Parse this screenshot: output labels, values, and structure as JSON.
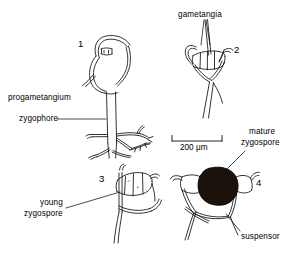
{
  "figure": {
    "background_color": "#ffffff",
    "line_color": "#000000",
    "fill_color": "#1a120b"
  },
  "panels": [
    {
      "id": "panel-1",
      "number": "1",
      "number_x": 78,
      "number_y": 38
    },
    {
      "id": "panel-2",
      "number": "2",
      "number_x": 234,
      "number_y": 44
    },
    {
      "id": "panel-3",
      "number": "3",
      "number_x": 99,
      "number_y": 173
    },
    {
      "id": "panel-4",
      "number": "4",
      "number_x": 256,
      "number_y": 177
    }
  ],
  "labels": {
    "progametangium": "progametangium",
    "zygophore": "zygophore",
    "gametangia": "gametangia",
    "mature_zygospore_line1": "mature",
    "mature_zygospore_line2": "zygospore",
    "young_zygospore_line1": "young",
    "young_zygospore_line2": "zygospore",
    "suspensor": "suspensor"
  },
  "scale_bar": {
    "label": "200 μm",
    "x1": 172,
    "x2": 222,
    "y": 141
  },
  "sex_symbols": {
    "male": "♂",
    "female": "♀"
  }
}
